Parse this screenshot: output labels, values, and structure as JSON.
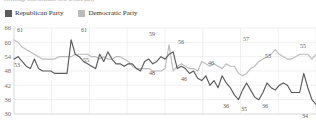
{
  "title_strip": "Percentage with favorable view of each party",
  "legend": {
    "items": [
      {
        "label": "Republican Party",
        "color": "#5b5b5b",
        "key": "republican"
      },
      {
        "label": "Democratic Party",
        "color": "#bcbcbc",
        "key": "democratic"
      }
    ]
  },
  "chart_data": {
    "type": "line",
    "title": "",
    "xlabel": "",
    "ylabel": "",
    "ylim": [
      30,
      66
    ],
    "yticks": [
      66,
      60,
      54,
      48,
      42,
      36,
      30
    ],
    "ytick_labels": [
      "66",
      "60",
      "54",
      "48",
      "42",
      "36",
      "30"
    ],
    "grid": true,
    "legend_position": "top-left",
    "x_gridline_count": 8,
    "series": [
      {
        "name": "Republican Party",
        "color": "#5b5b5b",
        "values": [
          53,
          54,
          52,
          50,
          49,
          53,
          49,
          48,
          48,
          48,
          47,
          47,
          47,
          47,
          61,
          55,
          54,
          52,
          51,
          50,
          49,
          55,
          52,
          56,
          53,
          51,
          51,
          50,
          51,
          51,
          49,
          48,
          52,
          53,
          51,
          52,
          54,
          53,
          55,
          56,
          49,
          50,
          49,
          47,
          48,
          45,
          44,
          46,
          42,
          44,
          41,
          46,
          43,
          41,
          38,
          36,
          40,
          43,
          40,
          37,
          36,
          39,
          43,
          41,
          40,
          42,
          43,
          42,
          39,
          39,
          39,
          47,
          41,
          36,
          34
        ]
      },
      {
        "name": "Democratic Party",
        "color": "#bcbcbc",
        "values": [
          61,
          60,
          58,
          57,
          56,
          55,
          54,
          53,
          53,
          53,
          53,
          54,
          54,
          54,
          54,
          55,
          55,
          55,
          55,
          54,
          54,
          53,
          54,
          53,
          53,
          54,
          54,
          53,
          52,
          50,
          49,
          49,
          49,
          49,
          48,
          48,
          48,
          49,
          59,
          48,
          50,
          51,
          50,
          49,
          49,
          48,
          52,
          51,
          50,
          51,
          50,
          49,
          51,
          50,
          50,
          47,
          46,
          47,
          49,
          50,
          52,
          53,
          54,
          55,
          57,
          55,
          54,
          53,
          53,
          54,
          55,
          55,
          55,
          53,
          55
        ]
      }
    ],
    "point_labels": [
      {
        "text": "61",
        "series": "democratic",
        "x_index": 0,
        "value": 61,
        "px": 20,
        "py": 10
      },
      {
        "text": "53",
        "series": "republican",
        "x_index": 0,
        "value": 53,
        "px": 17,
        "py": 45
      },
      {
        "text": "61",
        "series": "republican",
        "x_index": 14,
        "value": 61,
        "px": 84,
        "py": 10
      },
      {
        "text": "55",
        "series": "republican",
        "x_index": 15,
        "value": 55,
        "px": 86,
        "py": 40
      },
      {
        "text": "59",
        "series": "democratic",
        "x_index": 38,
        "value": 59,
        "px": 152,
        "py": 14
      },
      {
        "text": "48",
        "series": "democratic",
        "x_index": 39,
        "value": 48,
        "px": 152,
        "py": 53
      },
      {
        "text": "56",
        "series": "republican",
        "x_index": 39,
        "value": 56,
        "px": 181,
        "py": 22
      },
      {
        "text": "46",
        "series": "democratic",
        "x_index": 56,
        "value": 46,
        "px": 184,
        "py": 59
      },
      {
        "text": "46",
        "series": "democratic",
        "x_index": 47,
        "value": 46,
        "px": 211,
        "py": 43
      },
      {
        "text": "57",
        "series": "democratic",
        "x_index": 64,
        "value": 57,
        "px": 246,
        "py": 19
      },
      {
        "text": "53",
        "series": "democratic",
        "x_index": 68,
        "value": 53,
        "px": 268,
        "py": 36
      },
      {
        "text": "55",
        "series": "democratic",
        "x_index": 74,
        "value": 55,
        "px": 303,
        "py": 26
      },
      {
        "text": "36",
        "series": "republican",
        "x_index": 55,
        "value": 36,
        "px": 226,
        "py": 86
      },
      {
        "text": "35",
        "series": "republican",
        "x_index": 60,
        "value": 35,
        "px": 244,
        "py": 89
      },
      {
        "text": "36",
        "series": "republican",
        "x_index": 61,
        "value": 36,
        "px": 265,
        "py": 86
      },
      {
        "text": "34",
        "series": "republican",
        "x_index": 74,
        "value": 34,
        "px": 305,
        "py": 96
      }
    ]
  }
}
